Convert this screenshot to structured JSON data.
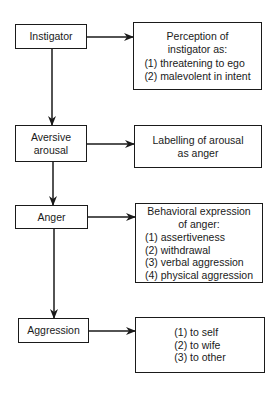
{
  "diagram": {
    "type": "flowchart",
    "stages": [
      {
        "id": "instigator",
        "label": "Instigator",
        "detail": {
          "title": [
            "Perception of",
            "instigator as:"
          ],
          "items": [
            "(1) threatening to ego",
            "(2) malevolent in intent"
          ]
        }
      },
      {
        "id": "aversive-arousal",
        "label": "Aversive arousal",
        "label_lines": [
          "Aversive",
          "arousal"
        ],
        "detail": {
          "title": [
            "Labelling of arousal",
            "as anger"
          ],
          "items": []
        }
      },
      {
        "id": "anger",
        "label": "Anger",
        "detail": {
          "title": [
            "Behavioral expression",
            "of anger:"
          ],
          "items": [
            "(1) assertiveness",
            "(2) withdrawal",
            "(3) verbal aggression",
            "(4) physical aggression"
          ]
        }
      },
      {
        "id": "aggression",
        "label": "Aggression",
        "detail": {
          "title": [],
          "items": [
            "(1) to self",
            "(2) to wife",
            "(3) to other"
          ]
        }
      }
    ],
    "edges": [
      {
        "from": "instigator",
        "to": "perception",
        "direction": "right"
      },
      {
        "from": "instigator",
        "to": "aversive-arousal",
        "direction": "down"
      },
      {
        "from": "aversive-arousal",
        "to": "labelling",
        "direction": "right"
      },
      {
        "from": "aversive-arousal",
        "to": "anger",
        "direction": "down"
      },
      {
        "from": "anger",
        "to": "behavioral-expression",
        "direction": "right"
      },
      {
        "from": "anger",
        "to": "aggression",
        "direction": "down"
      },
      {
        "from": "aggression",
        "to": "targets",
        "direction": "right"
      }
    ],
    "colors": {
      "line": "#1a1a1a",
      "background": "#ffffff"
    }
  }
}
